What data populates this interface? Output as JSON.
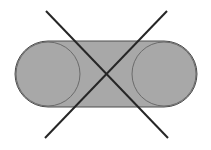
{
  "figure": {
    "canvas": {
      "width": 211,
      "height": 150,
      "background_color": "#ffffff"
    },
    "colors": {
      "fill_gray": "#a8a8a8",
      "outline_dark": "#4d4d4d",
      "cross_line": "#262626",
      "circle_outline": "#6b6b6b"
    },
    "capsule": {
      "label": "stadium-shape",
      "x": 15,
      "y": 41,
      "width": 182,
      "height": 66,
      "corner_radius": 33,
      "fill": "#a8a8a8",
      "stroke": "#4d4d4d",
      "stroke_width": 1
    },
    "circles": [
      {
        "label": "left-circle",
        "cx": 48,
        "cy": 74,
        "r": 32,
        "stroke": "#6b6b6b",
        "stroke_width": 1,
        "fill": "none"
      },
      {
        "label": "right-circle",
        "cx": 164,
        "cy": 74,
        "r": 32,
        "stroke": "#6b6b6b",
        "stroke_width": 1,
        "fill": "none"
      }
    ],
    "cross_lines": [
      {
        "label": "diagonal-down-right",
        "x1": 46,
        "y1": 11,
        "x2": 168,
        "y2": 138,
        "stroke": "#262626",
        "stroke_width": 2
      },
      {
        "label": "diagonal-down-left",
        "x1": 167,
        "y1": 11,
        "x2": 45,
        "y2": 138,
        "stroke": "#262626",
        "stroke_width": 2
      }
    ],
    "cross_center": {
      "x": 106,
      "y": 74
    }
  }
}
